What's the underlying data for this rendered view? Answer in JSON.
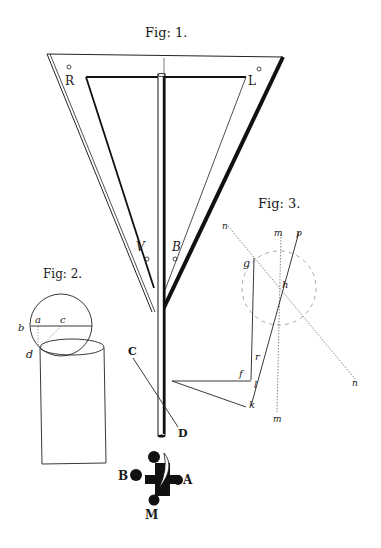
{
  "plate": {
    "fig1": {
      "title": "Fig: 1.",
      "labels": {
        "R": "R",
        "L": "L",
        "V": "V",
        "B": "B",
        "C": "C",
        "D": "D"
      }
    },
    "fig2": {
      "title": "Fig: 2.",
      "labels": {
        "a": "a",
        "b": "b",
        "c": "c",
        "d": "d"
      }
    },
    "fig3": {
      "title": "Fig: 3.",
      "labels": {
        "n1": "n",
        "n2": "n",
        "m1": "m",
        "m2": "m",
        "p": "p",
        "g": "g",
        "h": "h",
        "r": "r",
        "f": "f",
        "l": "l",
        "k": "k"
      }
    },
    "emblem": {
      "labels": {
        "A": "A",
        "B": "B",
        "M": "M"
      }
    }
  }
}
